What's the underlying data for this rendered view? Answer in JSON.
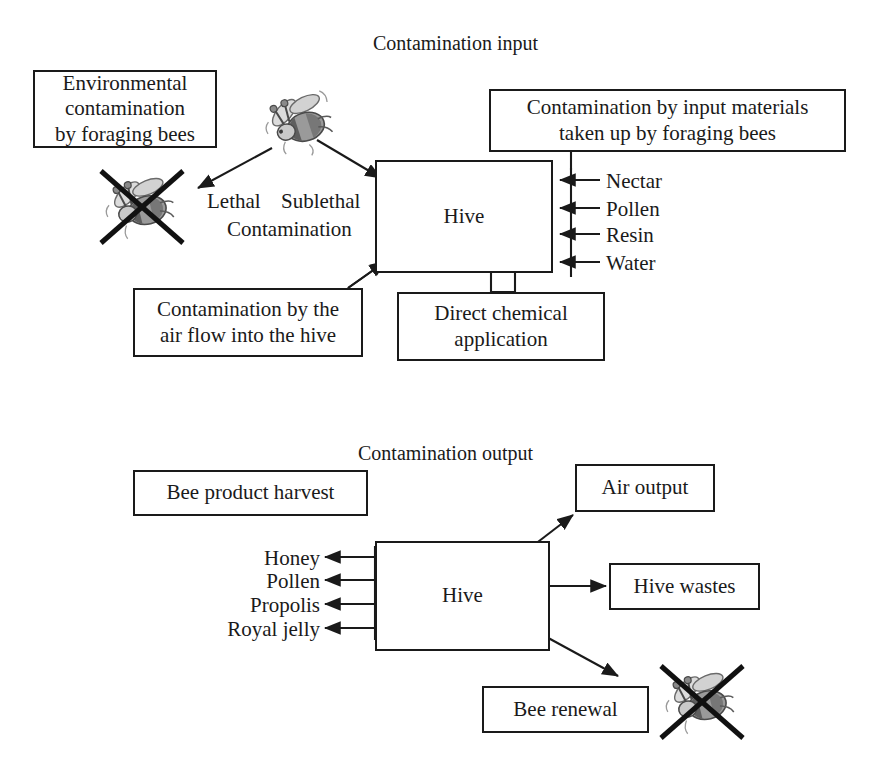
{
  "diagram": {
    "title_top": "Contamination input",
    "title_bottom": "Contamination output",
    "accent_color": "#1a1a1a",
    "background_color": "#ffffff",
    "bee_color": "#8d8d8d"
  },
  "input_section": {
    "heading": "Contamination input",
    "boxes": {
      "environmental": {
        "line1": "Environmental",
        "line2": "contamination",
        "line3": "by foraging bees"
      },
      "input_materials": {
        "line1": "Contamination by input materials",
        "line2": "taken up by foraging bees"
      },
      "air_flow": {
        "line1": "Contamination by the",
        "line2": "air flow into the hive"
      },
      "direct_chemical": {
        "line1": "Direct chemical",
        "line2": "application"
      },
      "hive": "Hive"
    },
    "path_labels": {
      "lethal": "Lethal",
      "sublethal": "Sublethal",
      "contamination": "Contamination"
    },
    "input_materials_list": [
      "Nectar",
      "Pollen",
      "Resin",
      "Water"
    ],
    "icons": {
      "foraging_bee": "bee-icon",
      "dead_bee": "crossed-out-bee-icon"
    }
  },
  "output_section": {
    "heading": "Contamination output",
    "boxes": {
      "bee_product_harvest": "Bee product harvest",
      "air_output": "Air output",
      "hive_wastes": "Hive wastes",
      "bee_renewal": "Bee renewal",
      "hive": "Hive"
    },
    "harvest_products": [
      "Honey",
      "Pollen",
      "Propolis",
      "Royal jelly"
    ],
    "icons": {
      "dead_bee": "crossed-out-bee-icon"
    }
  }
}
